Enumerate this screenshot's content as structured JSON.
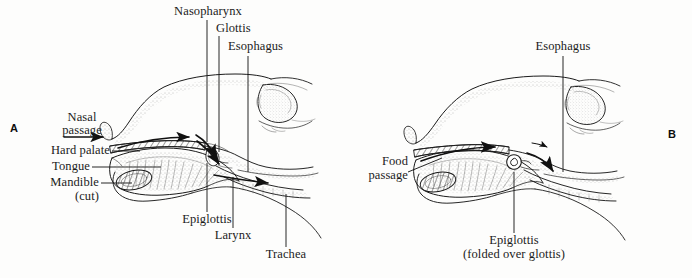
{
  "figure": {
    "background_color": "#fdfdfc",
    "ink_color": "#1b1b1b",
    "width": 692,
    "height": 278
  },
  "panels": [
    {
      "id": "A",
      "marker": "A",
      "caption": "Breathing position — epiglottis open, air passes to trachea"
    },
    {
      "id": "B",
      "marker": "B",
      "caption": "Swallowing position — epiglottis folded over glottis"
    }
  ],
  "panel_a": {
    "marker": "A",
    "labels": {
      "nasopharynx": "Nasopharynx",
      "glottis": "Glottis",
      "esophagus": "Esophagus",
      "nasal_passage_line1": "Nasal",
      "nasal_passage_line2": "passage",
      "hard_palate": "Hard palate",
      "tongue": "Tongue",
      "mandible_line1": "Mandible",
      "mandible_line2": "(cut)",
      "epiglottis": "Epiglottis",
      "larynx": "Larynx",
      "trachea": "Trachea"
    }
  },
  "panel_b": {
    "marker": "B",
    "labels": {
      "esophagus": "Esophagus",
      "food_passage_line1": "Food",
      "food_passage_line2": "passage",
      "epiglottis_line1": "Epiglottis",
      "epiglottis_line2": "(folded over glottis)"
    }
  }
}
